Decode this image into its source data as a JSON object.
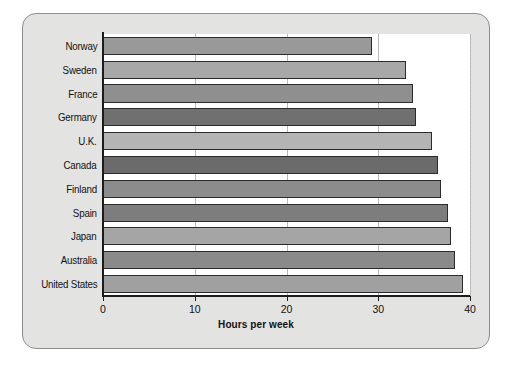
{
  "panel": {
    "background_color": "#e3e3e1",
    "border_color": "#8e8e8e"
  },
  "chart_data": {
    "type": "bar",
    "orientation": "horizontal",
    "title": "",
    "xlabel": "Hours per week",
    "ylabel": "",
    "xlim": [
      0,
      40
    ],
    "xticks": [
      0,
      10,
      20,
      30,
      40
    ],
    "xtick_labels": [
      "0",
      "10",
      "20",
      "30",
      "40"
    ],
    "grid": true,
    "grid_axis": "x",
    "legend": false,
    "categories": [
      "Norway",
      "Sweden",
      "France",
      "Germany",
      "U.K.",
      "Canada",
      "Finland",
      "Spain",
      "Japan",
      "Australia",
      "United States"
    ],
    "values": [
      29.3,
      33.0,
      33.8,
      34.1,
      35.9,
      36.5,
      36.8,
      37.6,
      37.9,
      38.4,
      39.2
    ],
    "bar_colors": [
      "#999999",
      "#a8a8a8",
      "#8f8f8f",
      "#707070",
      "#b4b4b4",
      "#6b6b6b",
      "#8c8c8c",
      "#7d7d7d",
      "#a5a5a5",
      "#8a8a8a",
      "#a0a0a0"
    ],
    "bar_edge_color": "#2b2b2b",
    "plot_background": "#ffffff"
  }
}
